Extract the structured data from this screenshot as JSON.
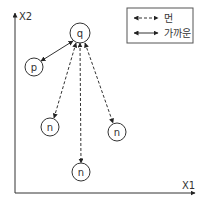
{
  "axes": {
    "x_label": "X1",
    "y_label": "X2"
  },
  "legend": {
    "items": [
      {
        "style": "dashed",
        "label": "먼"
      },
      {
        "style": "solid",
        "label": "가까운"
      }
    ]
  },
  "nodes": {
    "q": {
      "label": "q",
      "cx": 80,
      "cy": 33,
      "r": 10
    },
    "p": {
      "label": "p",
      "cx": 34,
      "cy": 67,
      "r": 9
    },
    "n1": {
      "label": "n",
      "cx": 50,
      "cy": 127,
      "r": 9
    },
    "n2": {
      "label": "n",
      "cx": 117,
      "cy": 132,
      "r": 9
    },
    "n3": {
      "label": "n",
      "cx": 81,
      "cy": 172,
      "r": 9
    }
  },
  "edges": [
    {
      "from": "q",
      "to": "p",
      "style": "solid",
      "meaning": "가까운"
    },
    {
      "from": "q",
      "to": "n1",
      "style": "dashed",
      "meaning": "먼"
    },
    {
      "from": "q",
      "to": "n2",
      "style": "dashed",
      "meaning": "먼"
    },
    {
      "from": "q",
      "to": "n3",
      "style": "dashed",
      "meaning": "먼"
    }
  ],
  "colors": {
    "line": "#333333",
    "background": "#ffffff"
  }
}
